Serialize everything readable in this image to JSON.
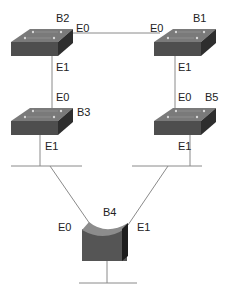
{
  "diagram": {
    "type": "network-topology",
    "colors": {
      "line": "#8a8a8a",
      "switch_top": "#7a7a7a",
      "switch_front": "#4e4e4e",
      "switch_side": "#2e2e2e",
      "label": "#222222"
    },
    "nodes": [
      {
        "id": "B2",
        "label": "B2",
        "kind": "switch",
        "ports": {
          "E0": "E0",
          "E1": "E1"
        }
      },
      {
        "id": "B1",
        "label": "B1",
        "kind": "switch",
        "ports": {
          "E0": "E0",
          "E1": "E1"
        }
      },
      {
        "id": "B3",
        "label": "B3",
        "kind": "switch",
        "ports": {
          "E0": "E0",
          "E1": "E1"
        }
      },
      {
        "id": "B5",
        "label": "B5",
        "kind": "switch",
        "ports": {
          "E0": "E0",
          "E1": "E1"
        }
      },
      {
        "id": "B4",
        "label": "B4",
        "kind": "bridge",
        "ports": {
          "E0": "E0",
          "E1": "E1"
        }
      }
    ],
    "links": [
      {
        "from": "B2.E0",
        "to": "B1.E0"
      },
      {
        "from": "B2.E1",
        "to": "B3.E0"
      },
      {
        "from": "B1.E1",
        "to": "B5.E0"
      },
      {
        "from": "B3.E1",
        "to": "LAN-left"
      },
      {
        "from": "B5.E1",
        "to": "LAN-right"
      },
      {
        "from": "LAN-left",
        "to": "B4.E0"
      },
      {
        "from": "LAN-right",
        "to": "B4.E1"
      },
      {
        "from": "B4",
        "to": "LAN-bottom"
      }
    ]
  }
}
